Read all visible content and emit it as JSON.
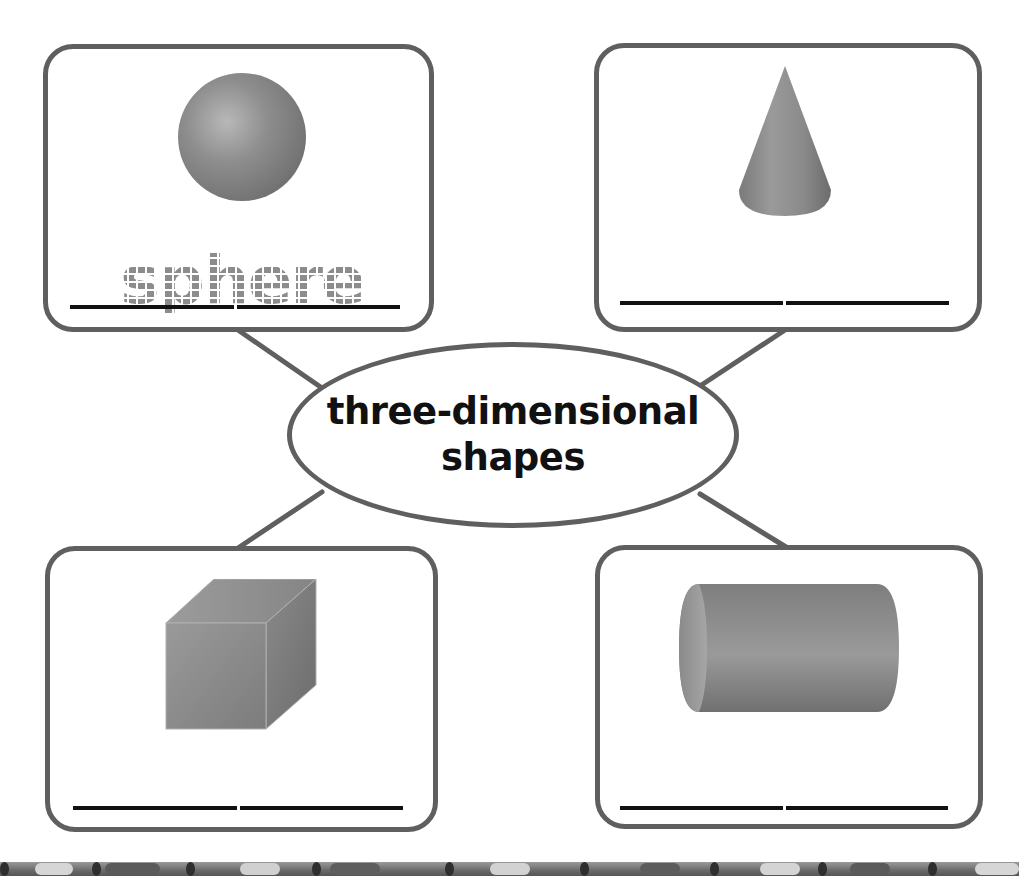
{
  "worksheet": {
    "center_topic": {
      "line1": "three-dimensional",
      "line2": "shapes"
    },
    "boxes": [
      {
        "position": "top-left",
        "shape": "sphere",
        "shape_icon": "sphere-icon",
        "traced_word": "sphere",
        "answer_value": ""
      },
      {
        "position": "top-right",
        "shape": "cone",
        "shape_icon": "cone-icon",
        "traced_word": "",
        "answer_value": ""
      },
      {
        "position": "bottom-left",
        "shape": "cube",
        "shape_icon": "cube-icon",
        "traced_word": "",
        "answer_value": ""
      },
      {
        "position": "bottom-right",
        "shape": "cylinder",
        "shape_icon": "cylinder-icon",
        "traced_word": "",
        "answer_value": ""
      }
    ],
    "colors": {
      "outline": "#5f5f5f",
      "shape_fill": "#8a8a8a",
      "text": "#111111",
      "trace_text": "#8c8c8c"
    }
  }
}
